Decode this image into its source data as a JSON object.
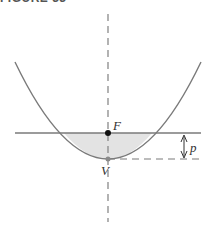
{
  "caption_fragment": "FIGURE 33",
  "diagram": {
    "labels": {
      "focus": "F",
      "vertex": "V",
      "distance": "p"
    },
    "colors": {
      "curve": "#7a7a7a",
      "axis": "#8a8a8a",
      "fill": "#e3e3e3",
      "point": "#111111",
      "vertex_point": "#8a8a8a"
    },
    "geometry": {
      "axis_x": 108,
      "focus_y": 133,
      "vertex_y": 159,
      "left_end": [
        15,
        62
      ],
      "right_end": [
        201,
        62
      ]
    }
  }
}
